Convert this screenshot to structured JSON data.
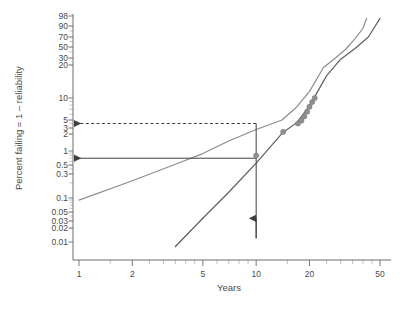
{
  "chart_data": {
    "type": "scatter",
    "title": "",
    "xlabel": "Years",
    "ylabel": "Percent failing = 1 – reliability",
    "x_scale": "log",
    "y_scale": "probability-log",
    "xlim": [
      1,
      50
    ],
    "ylim": [
      0.01,
      98
    ],
    "grid": false,
    "legend": "none",
    "x_ticks": [
      {
        "value": 1,
        "label": "1"
      },
      {
        "value": 2,
        "label": "2"
      },
      {
        "value": 5,
        "label": "5"
      },
      {
        "value": 10,
        "label": "10"
      },
      {
        "value": 20,
        "label": "20"
      },
      {
        "value": 50,
        "label": "50"
      }
    ],
    "y_ticks": [
      {
        "value": 98,
        "label": "98"
      },
      {
        "value": 90,
        "label": "90"
      },
      {
        "value": 70,
        "label": "70"
      },
      {
        "value": 50,
        "label": "50"
      },
      {
        "value": 30,
        "label": "30"
      },
      {
        "value": 20,
        "label": "20"
      },
      {
        "value": 10,
        "label": "10"
      },
      {
        "value": 5,
        "label": "5"
      },
      {
        "value": 3,
        "label": "3"
      },
      {
        "value": 2,
        "label": "2"
      },
      {
        "value": 1,
        "label": "1"
      },
      {
        "value": 0.5,
        "label": "0.5"
      },
      {
        "value": 0.3,
        "label": "0.3"
      },
      {
        "value": 0.1,
        "label": "0.1"
      },
      {
        "value": 0.05,
        "label": "0.05"
      },
      {
        "value": 0.03,
        "label": "0.03"
      },
      {
        "value": 0.02,
        "label": "0.02"
      },
      {
        "value": 0.01,
        "label": "0.01"
      }
    ],
    "points": [
      {
        "x": 10.0,
        "y": 0.8
      },
      {
        "x": 14.2,
        "y": 2.3
      },
      {
        "x": 17.2,
        "y": 4.0
      },
      {
        "x": 18.0,
        "y": 4.8
      },
      {
        "x": 18.7,
        "y": 5.6
      },
      {
        "x": 19.4,
        "y": 6.5
      },
      {
        "x": 20.0,
        "y": 7.6
      },
      {
        "x": 20.7,
        "y": 8.8
      },
      {
        "x": 21.4,
        "y": 10.0
      }
    ],
    "series": [
      {
        "name": "lognormal-fit",
        "type": "line",
        "style": "solid",
        "color": "#8d8d8d",
        "points": [
          {
            "x": 1.0,
            "y": 0.09
          },
          {
            "x": 2.0,
            "y": 0.22
          },
          {
            "x": 3.5,
            "y": 0.52
          },
          {
            "x": 5.0,
            "y": 0.88
          },
          {
            "x": 7.0,
            "y": 1.5
          },
          {
            "x": 10.0,
            "y": 2.7
          },
          {
            "x": 14.0,
            "y": 5.0
          },
          {
            "x": 17.0,
            "y": 7.6
          },
          {
            "x": 20.0,
            "y": 11.5
          },
          {
            "x": 24.0,
            "y": 19.0
          },
          {
            "x": 28.0,
            "y": 30.0
          },
          {
            "x": 32.0,
            "y": 45.0
          },
          {
            "x": 36.0,
            "y": 65.0
          },
          {
            "x": 40.0,
            "y": 85.0
          },
          {
            "x": 42.0,
            "y": 96.0
          }
        ]
      },
      {
        "name": "weibull-fit",
        "type": "line",
        "style": "solid",
        "color": "#5e5e5e",
        "points": [
          {
            "x": 3.5,
            "y": 0.008
          },
          {
            "x": 5.0,
            "y": 0.035
          },
          {
            "x": 7.0,
            "y": 0.13
          },
          {
            "x": 10.0,
            "y": 0.55
          },
          {
            "x": 14.0,
            "y": 2.1
          },
          {
            "x": 17.0,
            "y": 4.3
          },
          {
            "x": 20.0,
            "y": 7.8
          },
          {
            "x": 25.0,
            "y": 16.0
          },
          {
            "x": 30.0,
            "y": 28.0
          },
          {
            "x": 36.0,
            "y": 46.0
          },
          {
            "x": 43.0,
            "y": 70.0
          },
          {
            "x": 50.0,
            "y": 96.0
          }
        ]
      }
    ],
    "annotations": [
      {
        "name": "upper-projection-line",
        "kind": "arrow-left",
        "style": "dashed",
        "color": "#3f3f3f",
        "y_value": 4.0,
        "from_x": 10.0,
        "to_x": 1.0,
        "description": "Dashed horizontal arrow from the 10-year point on the lognormal curve back to the y-axis at about 4 percent failing"
      },
      {
        "name": "lower-projection-line",
        "kind": "arrow-left",
        "style": "solid",
        "color": "#3f3f3f",
        "y_value": 0.7,
        "from_x": 10.0,
        "to_x": 1.0,
        "description": "Solid horizontal arrow from the 10-year point on the Weibull line back to the y-axis at about 0.7 percent failing"
      },
      {
        "name": "ten-year-vertical-line",
        "kind": "arrow-up",
        "style": "solid",
        "color": "#3f3f3f",
        "x_value": 10.0,
        "from_y": 0.012,
        "to_y": 4.0,
        "description": "Vertical line rising at 10 years with an upward arrowhead"
      }
    ]
  },
  "axes": {
    "ylabel": "Percent failing = 1 – reliability",
    "xlabel": "Years"
  },
  "caption": {
    "text": ""
  }
}
